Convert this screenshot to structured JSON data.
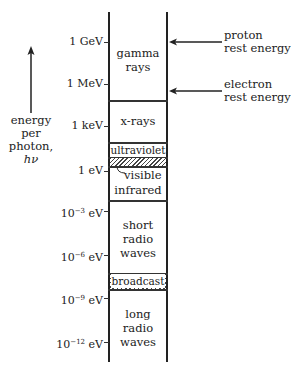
{
  "diagram": {
    "axis": {
      "label_lines": [
        "energy",
        "per",
        "photon,",
        "hν"
      ],
      "direction": "up"
    },
    "ticks": [
      {
        "mantissa": "1 GeV",
        "exp": "",
        "unit": ""
      },
      {
        "mantissa": "1 MeV",
        "exp": "",
        "unit": ""
      },
      {
        "mantissa": "1 keV",
        "exp": "",
        "unit": ""
      },
      {
        "mantissa": "1 eV",
        "exp": "",
        "unit": ""
      },
      {
        "mantissa": "10",
        "exp": "−3",
        "unit": " eV"
      },
      {
        "mantissa": "10",
        "exp": "−6",
        "unit": " eV"
      },
      {
        "mantissa": "10",
        "exp": "−9",
        "unit": " eV"
      },
      {
        "mantissa": "10",
        "exp": "−12",
        "unit": " eV"
      }
    ],
    "bands": [
      {
        "lines": [
          "gamma",
          "rays"
        ]
      },
      {
        "lines": [
          "x-rays"
        ]
      },
      {
        "lines": [
          "ultraviolet"
        ]
      },
      {
        "lines": [
          "visible"
        ]
      },
      {
        "lines": [
          "infrared"
        ]
      },
      {
        "lines": [
          "short",
          "radio",
          "waves"
        ]
      },
      {
        "lines": [
          "broadcast"
        ]
      },
      {
        "lines": [
          "long",
          "radio",
          "waves"
        ]
      }
    ],
    "annotations": [
      {
        "lines": [
          "proton",
          "rest energy"
        ]
      },
      {
        "lines": [
          "electron",
          "rest energy"
        ]
      }
    ]
  }
}
